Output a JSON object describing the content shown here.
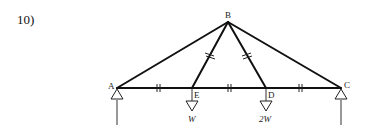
{
  "problem": {
    "number_label": "10)"
  },
  "nodes": {
    "A": {
      "label": "A",
      "x": 117,
      "y": 88
    },
    "B": {
      "label": "B",
      "x": 228,
      "y": 22
    },
    "C": {
      "label": "C",
      "x": 341,
      "y": 88
    },
    "D": {
      "label": "D",
      "x": 266,
      "y": 88
    },
    "E": {
      "label": "E",
      "x": 192,
      "y": 88
    }
  },
  "members": [
    "AB",
    "BC",
    "BE",
    "BD",
    "AE",
    "ED",
    "DC"
  ],
  "equal_length_marks": {
    "bottom_chord": [
      "AE",
      "ED",
      "DC"
    ],
    "diagonals": [
      "BE",
      "BD"
    ]
  },
  "supports": [
    {
      "node": "A",
      "type": "pin-triangle",
      "reaction_arrow": "up"
    },
    {
      "node": "C",
      "type": "pin-triangle",
      "reaction_arrow": "up"
    }
  ],
  "loads": [
    {
      "node": "E",
      "label": "W"
    },
    {
      "node": "D",
      "label": "2W"
    }
  ],
  "colors": {
    "line": "#111111",
    "background": "#ffffff"
  }
}
